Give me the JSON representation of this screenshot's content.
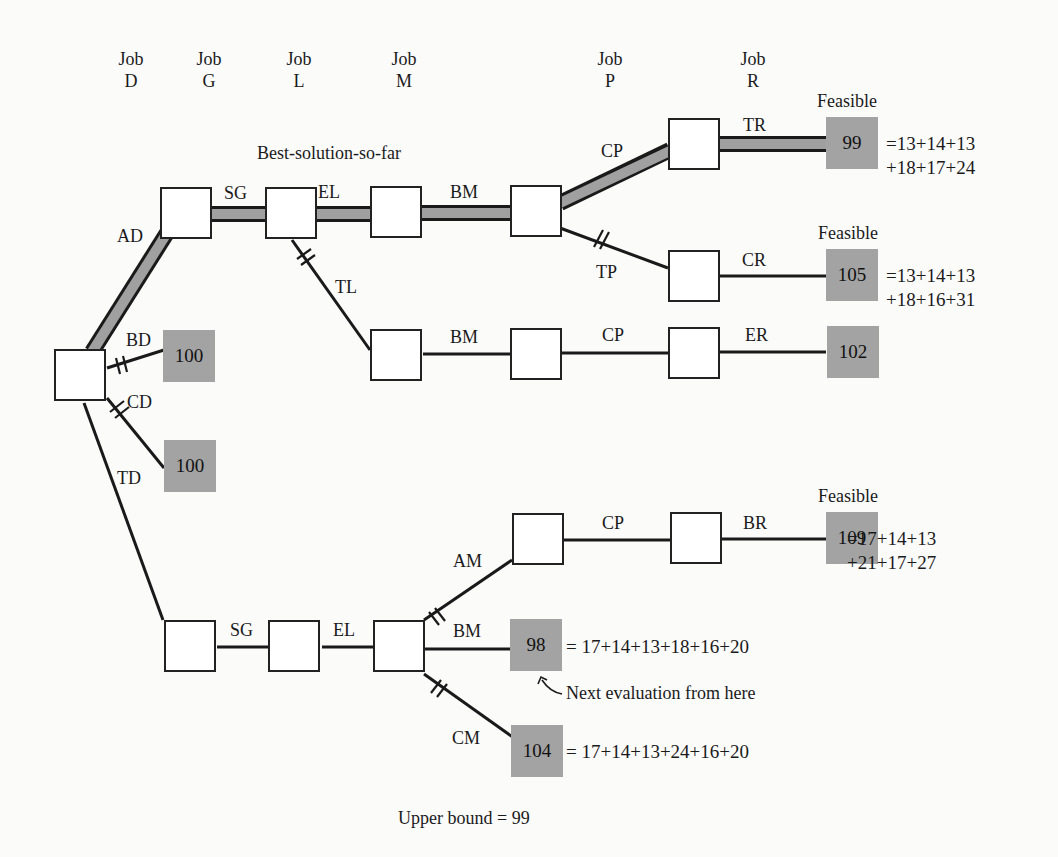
{
  "headers": [
    {
      "job": "Job",
      "id": "D"
    },
    {
      "job": "Job",
      "id": "G"
    },
    {
      "job": "Job",
      "id": "L"
    },
    {
      "job": "Job",
      "id": "M"
    },
    {
      "job": "Job",
      "id": "P"
    },
    {
      "job": "Job",
      "id": "R"
    }
  ],
  "annotations": {
    "best_solution": "Best-solution-so-far",
    "feasible": "Feasible",
    "next_eval": "Next evaluation from here",
    "upper_bound": "Upper bound = 99"
  },
  "edges": {
    "AD": "AD",
    "BD": "BD",
    "CD": "CD",
    "TD": "TD",
    "SG_top": "SG",
    "EL_top": "EL",
    "BM_top": "BM",
    "CP_top": "CP",
    "TR": "TR",
    "TP": "TP",
    "CR": "CR",
    "TL": "TL",
    "BM_mid": "BM",
    "CP_mid": "CP",
    "ER": "ER",
    "SG_bot": "SG",
    "EL_bot": "EL",
    "AM": "AM",
    "CP_bot": "CP",
    "BR": "BR",
    "BM_bot": "BM",
    "CM": "CM"
  },
  "leaves": {
    "tr": "99",
    "cr": "105",
    "er": "102",
    "bd": "100",
    "cd": "100",
    "br": "109",
    "bm": "98",
    "cm": "104"
  },
  "equations": {
    "tr_line1": "=13+14+13",
    "tr_line2": "+18+17+24",
    "cr_line1": "=13+14+13",
    "cr_line2": "+18+16+31",
    "br_line1": "=17+14+13",
    "br_line2": "+21+17+27",
    "bm": "= 17+14+13+18+16+20",
    "cm": "= 17+14+13+24+16+20"
  },
  "colors": {
    "leaf_fill": "#a3a3a3",
    "best_path_fill": "#a0a0a0",
    "line": "#1a1a1a"
  }
}
